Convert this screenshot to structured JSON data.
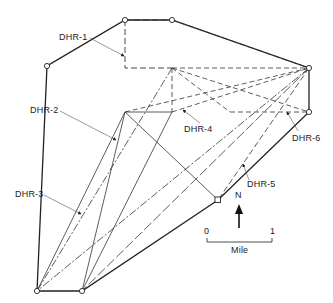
{
  "diagram": {
    "labels": {
      "dhr1": "DHR-1",
      "dhr2": "DHR-2",
      "dhr3": "DHR-3",
      "dhr4": "DHR-4",
      "dhr5": "DHR-5",
      "dhr6": "DHR-6"
    },
    "north_arrow": "N",
    "scale_bar": {
      "start": "0",
      "end": "1",
      "unit": "Mile"
    },
    "colors": {
      "line": "#222222",
      "background": "#ffffff"
    }
  }
}
